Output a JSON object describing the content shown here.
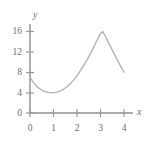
{
  "chart_data": {
    "type": "line",
    "title": "",
    "subtitle": "",
    "xlabel": "x",
    "ylabel": "y",
    "xlim": [
      0,
      4
    ],
    "ylim": [
      0,
      16
    ],
    "xticks": [
      0,
      1,
      2,
      3,
      4
    ],
    "yticks": [
      0,
      4,
      8,
      12,
      16
    ],
    "xtick_labels": [
      "0",
      "1",
      "2",
      "3",
      "4"
    ],
    "ytick_labels": [
      "0",
      "4",
      "8",
      "12",
      "16"
    ],
    "grid": false,
    "legend": null,
    "annotations": [],
    "series": [
      {
        "name": "curve",
        "color": "#b0b0b0",
        "x": [
          0.0,
          0.1,
          0.2,
          0.3,
          0.4,
          0.5,
          0.6,
          0.7,
          0.8,
          0.9,
          1.0,
          1.1,
          1.2,
          1.3,
          1.4,
          1.5,
          1.6,
          1.7,
          1.8,
          1.9,
          2.0,
          2.2,
          2.4,
          2.6,
          2.8,
          3.0,
          3.1,
          3.3,
          3.55,
          3.8,
          4.0
        ],
        "y": [
          7.0,
          6.3,
          5.7,
          5.2,
          4.8,
          4.5,
          4.28,
          4.12,
          4.04,
          4.0,
          4.0,
          4.06,
          4.18,
          4.36,
          4.6,
          4.9,
          5.26,
          5.68,
          6.16,
          6.7,
          7.3,
          8.7,
          10.2,
          11.9,
          13.8,
          15.6,
          16.0,
          14.2,
          11.9,
          9.7,
          8.0
        ]
      }
    ]
  },
  "axes": {
    "y_axis_name": "y",
    "x_axis_name": "x",
    "tick_color": "#9a9a9a",
    "axis_color": "#8f8f8f",
    "curve_color": "#b4b4b4",
    "label_color": "#6e6e6e",
    "background_color": "#ffffff"
  }
}
